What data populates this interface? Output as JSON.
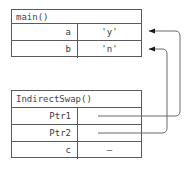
{
  "diagram": {
    "type": "memory-stack-frame-pointer-diagram",
    "line_color": "#5a5a5a",
    "text_color": "#3a3a3a",
    "background": "#ffffff",
    "frames": [
      {
        "id": "main",
        "title": "main()",
        "rows": [
          {
            "name": "a",
            "value": "'y'"
          },
          {
            "name": "b",
            "value": "'n'"
          }
        ]
      },
      {
        "id": "indirectswap",
        "title": "IndirectSwap()",
        "rows": [
          {
            "name": "Ptr1",
            "value": ""
          },
          {
            "name": "Ptr2",
            "value": ""
          },
          {
            "name": "c",
            "value": "–"
          }
        ]
      }
    ],
    "pointers": [
      {
        "from": "Ptr1",
        "to": "a",
        "style": "curved-arrow"
      },
      {
        "from": "Ptr2",
        "to": "b",
        "style": "curved-arrow"
      }
    ]
  }
}
